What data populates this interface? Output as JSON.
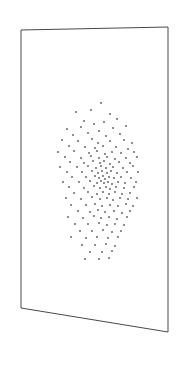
{
  "scene": {
    "title": "3D perspective plane with scatter point cloud",
    "background_color": "#ffffff",
    "width": 182,
    "height": 369
  },
  "plane": {
    "label": "perspective-rectangle-frame",
    "stroke_color": "#4a4a4a",
    "fill_color": "#ffffff",
    "stroke_width": 1,
    "corners": {
      "top_left": [
        21,
        30
      ],
      "top_right": [
        168,
        27
      ],
      "bottom_right": [
        168,
        332
      ],
      "bottom_left": [
        21,
        308
      ]
    }
  },
  "chart_data": {
    "type": "scatter",
    "title": "",
    "xlabel": "",
    "ylabel": "",
    "grid": false,
    "legend": null,
    "point_color": "#757575",
    "point_radius": 1.1,
    "n_points": 126,
    "xlim": [
      55,
      140
    ],
    "ylim": [
      100,
      262
    ],
    "points": [
      [
        101,
        103
      ],
      [
        91,
        110
      ],
      [
        76,
        112
      ],
      [
        110,
        114
      ],
      [
        84,
        121
      ],
      [
        81,
        127
      ],
      [
        94,
        124
      ],
      [
        104,
        122
      ],
      [
        117,
        119
      ],
      [
        67,
        129
      ],
      [
        99,
        131
      ],
      [
        113,
        128
      ],
      [
        126,
        126
      ],
      [
        88,
        133
      ],
      [
        73,
        135
      ],
      [
        106,
        136
      ],
      [
        120,
        134
      ],
      [
        62,
        140
      ],
      [
        78,
        141
      ],
      [
        92,
        139
      ],
      [
        98,
        143
      ],
      [
        110,
        141
      ],
      [
        124,
        140
      ],
      [
        132,
        143
      ],
      [
        69,
        146
      ],
      [
        85,
        147
      ],
      [
        95,
        148
      ],
      [
        103,
        146
      ],
      [
        116,
        147
      ],
      [
        128,
        149
      ],
      [
        58,
        152
      ],
      [
        74,
        151
      ],
      [
        89,
        153
      ],
      [
        97,
        151
      ],
      [
        105,
        154
      ],
      [
        112,
        152
      ],
      [
        121,
        153
      ],
      [
        134,
        152
      ],
      [
        65,
        157
      ],
      [
        81,
        158
      ],
      [
        91,
        156
      ],
      [
        99,
        158
      ],
      [
        107,
        157
      ],
      [
        115,
        159
      ],
      [
        126,
        158
      ],
      [
        137,
        157
      ],
      [
        70,
        162
      ],
      [
        84,
        163
      ],
      [
        93,
        161
      ],
      [
        100,
        163
      ],
      [
        104,
        161
      ],
      [
        110,
        164
      ],
      [
        119,
        162
      ],
      [
        130,
        163
      ],
      [
        60,
        167
      ],
      [
        77,
        167
      ],
      [
        88,
        166
      ],
      [
        96,
        168
      ],
      [
        101,
        166
      ],
      [
        106,
        168
      ],
      [
        113,
        167
      ],
      [
        123,
        168
      ],
      [
        133,
        166
      ],
      [
        67,
        172
      ],
      [
        82,
        172
      ],
      [
        92,
        171
      ],
      [
        98,
        173
      ],
      [
        102,
        171
      ],
      [
        107,
        173
      ],
      [
        111,
        171
      ],
      [
        117,
        173
      ],
      [
        127,
        172
      ],
      [
        138,
        172
      ],
      [
        72,
        177
      ],
      [
        86,
        177
      ],
      [
        95,
        176
      ],
      [
        99,
        178
      ],
      [
        103,
        176
      ],
      [
        105,
        179
      ],
      [
        109,
        177
      ],
      [
        114,
        178
      ],
      [
        121,
        177
      ],
      [
        131,
        178
      ],
      [
        63,
        182
      ],
      [
        79,
        182
      ],
      [
        90,
        181
      ],
      [
        97,
        183
      ],
      [
        101,
        181
      ],
      [
        104,
        183
      ],
      [
        108,
        182
      ],
      [
        112,
        184
      ],
      [
        118,
        182
      ],
      [
        125,
        183
      ],
      [
        136,
        182
      ],
      [
        69,
        187
      ],
      [
        84,
        188
      ],
      [
        94,
        186
      ],
      [
        100,
        188
      ],
      [
        106,
        187
      ],
      [
        110,
        189
      ],
      [
        116,
        187
      ],
      [
        124,
        188
      ],
      [
        134,
        187
      ],
      [
        74,
        193
      ],
      [
        88,
        192
      ],
      [
        97,
        194
      ],
      [
        103,
        192
      ],
      [
        109,
        194
      ],
      [
        115,
        192
      ],
      [
        122,
        194
      ],
      [
        130,
        193
      ],
      [
        66,
        198
      ],
      [
        81,
        199
      ],
      [
        92,
        197
      ],
      [
        100,
        199
      ],
      [
        107,
        198
      ],
      [
        113,
        200
      ],
      [
        120,
        198
      ],
      [
        128,
        199
      ],
      [
        137,
        198
      ],
      [
        71,
        205
      ],
      [
        86,
        205
      ],
      [
        95,
        204
      ],
      [
        102,
        206
      ],
      [
        110,
        205
      ],
      [
        118,
        206
      ],
      [
        126,
        204
      ],
      [
        133,
        206
      ],
      [
        78,
        211
      ],
      [
        90,
        212
      ],
      [
        98,
        210
      ],
      [
        105,
        212
      ],
      [
        114,
        211
      ],
      [
        122,
        213
      ],
      [
        130,
        211
      ],
      [
        68,
        217
      ],
      [
        83,
        218
      ],
      [
        94,
        216
      ],
      [
        101,
        218
      ],
      [
        109,
        217
      ],
      [
        117,
        219
      ],
      [
        127,
        217
      ],
      [
        75,
        224
      ],
      [
        88,
        224
      ],
      [
        99,
        223
      ],
      [
        107,
        225
      ],
      [
        115,
        224
      ],
      [
        124,
        225
      ],
      [
        80,
        231
      ],
      [
        92,
        231
      ],
      [
        103,
        230
      ],
      [
        112,
        232
      ],
      [
        121,
        231
      ],
      [
        71,
        237
      ],
      [
        86,
        238
      ],
      [
        97,
        237
      ],
      [
        108,
        238
      ],
      [
        118,
        237
      ],
      [
        82,
        245
      ],
      [
        95,
        245
      ],
      [
        106,
        244
      ],
      [
        115,
        246
      ],
      [
        90,
        252
      ],
      [
        102,
        252
      ],
      [
        112,
        251
      ],
      [
        85,
        259
      ],
      [
        99,
        259
      ],
      [
        109,
        258
      ]
    ]
  }
}
